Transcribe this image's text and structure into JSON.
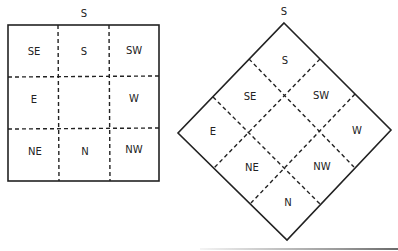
{
  "diagrams": {
    "square": {
      "top_label": "S",
      "cells": [
        "SE",
        "S",
        "SW",
        "E",
        "",
        "W",
        "NE",
        "N",
        "NW"
      ]
    },
    "diamond": {
      "top_label": "S",
      "cells": {
        "top": "S",
        "upper_left": "SE",
        "upper_right": "SW",
        "left": "E",
        "center": "",
        "right": "W",
        "lower_left": "NE",
        "lower_right": "NW",
        "bottom": "N"
      }
    }
  },
  "colors": {
    "line": "#222222",
    "background": "#ffffff"
  }
}
